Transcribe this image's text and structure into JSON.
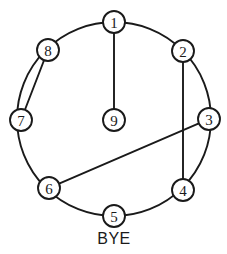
{
  "figure": {
    "background_color": "#ffffff",
    "stroke_color": "#1a1a1a",
    "width": 227,
    "height": 254
  },
  "caption": {
    "text": "BYE",
    "x": 114,
    "y": 238
  },
  "chart_data": {
    "type": "diagram",
    "subtype": "circular-graph",
    "title": "",
    "xlabel": "",
    "ylabel": "",
    "ring": {
      "label": "outer-circle",
      "cx": 114,
      "cy": 119,
      "r": 97
    },
    "node_radius": 11,
    "nodes": [
      {
        "id": "1",
        "label": "1",
        "x": 114,
        "y": 22,
        "on_ring": true,
        "angle_deg": 270
      },
      {
        "id": "2",
        "label": "2",
        "x": 183,
        "y": 51,
        "on_ring": true,
        "angle_deg": 315
      },
      {
        "id": "3",
        "label": "3",
        "x": 209,
        "y": 119,
        "on_ring": true,
        "angle_deg": 0
      },
      {
        "id": "4",
        "label": "4",
        "x": 183,
        "y": 190,
        "on_ring": true,
        "angle_deg": 45
      },
      {
        "id": "5",
        "label": "5",
        "x": 114,
        "y": 216,
        "on_ring": true,
        "angle_deg": 90
      },
      {
        "id": "6",
        "label": "6",
        "x": 49,
        "y": 188,
        "on_ring": true,
        "angle_deg": 135
      },
      {
        "id": "7",
        "label": "7",
        "x": 21,
        "y": 120,
        "on_ring": true,
        "angle_deg": 180
      },
      {
        "id": "8",
        "label": "8",
        "x": 48,
        "y": 50,
        "on_ring": true,
        "angle_deg": 225
      },
      {
        "id": "9",
        "label": "9",
        "x": 114,
        "y": 120,
        "on_ring": false,
        "angle_deg": null
      }
    ],
    "edges": [
      {
        "from": "1",
        "to": "9",
        "style": "straight"
      },
      {
        "from": "2",
        "to": "4",
        "style": "straight"
      },
      {
        "from": "3",
        "to": "6",
        "style": "straight"
      },
      {
        "from": "8",
        "to": "7",
        "style": "straight"
      }
    ]
  }
}
